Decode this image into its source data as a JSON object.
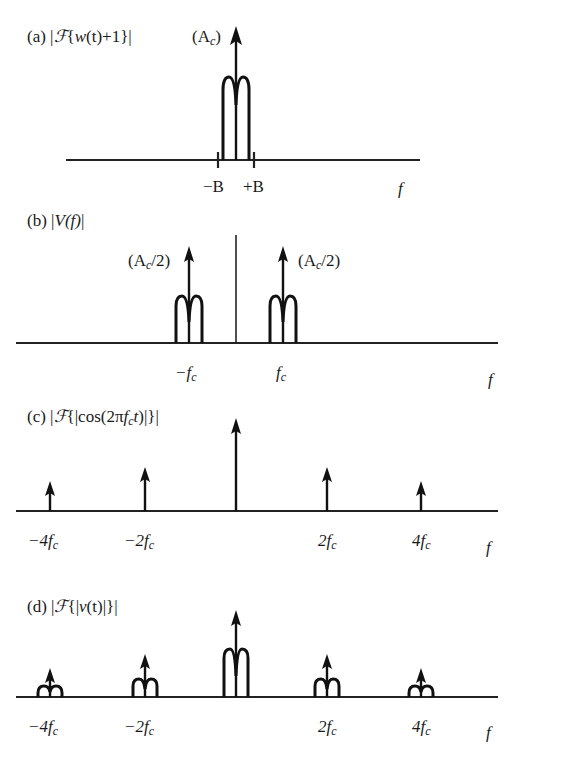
{
  "figure": {
    "panels": [
      {
        "id": "a",
        "title": "(a) |ℱ{w(t)+1}|",
        "title_parts": {
          "prefix": "(a) |",
          "F": "ℱ",
          "open": "{",
          "w": "w",
          "paren_t": "(t)",
          "rest": "+1}|"
        },
        "impulse_label": "(A",
        "impulse_label_sub": "c",
        "impulse_label_close": ")",
        "tick_labels": {
          "minus": "−B",
          "plus": "+B"
        },
        "axis_label": "f"
      },
      {
        "id": "b",
        "title_prefix": "(b) |",
        "title_V": "V",
        "title_f": "(f)",
        "title_close": "|",
        "impulse_label": "(A",
        "impulse_label_sub": "c",
        "impulse_label_close": "/2)",
        "tick_labels": {
          "neg": "−f",
          "pos": "f",
          "sub": "c"
        },
        "axis_label": "f"
      },
      {
        "id": "c",
        "title_prefix": "(c) |",
        "title_F": "ℱ",
        "title_mid": "{|cos(2π",
        "title_f": "f",
        "title_sub": "c",
        "title_t": "t",
        "title_close": ")|}|",
        "tick_labels": [
          "−4f",
          "−2f",
          "2f",
          "4f"
        ],
        "tick_sub": "c",
        "axis_label": "f"
      },
      {
        "id": "d",
        "title_prefix": "(d) |",
        "title_F": "ℱ",
        "title_mid": "{|",
        "title_v": "v",
        "title_t": "(t)",
        "title_close": "|}|",
        "tick_labels": [
          "−4f",
          "−2f",
          "2f",
          "4f"
        ],
        "tick_sub": "c",
        "axis_label": "f"
      }
    ]
  }
}
